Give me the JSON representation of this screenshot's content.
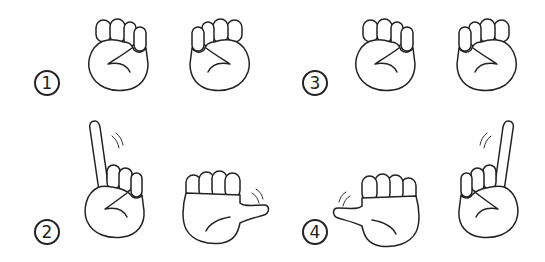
{
  "figure": {
    "line_color": "#222222",
    "background": "#ffffff",
    "steps": [
      {
        "number": "1",
        "label": "Both hands in fists",
        "left_hand": "fist",
        "right_hand": "fist"
      },
      {
        "number": "2",
        "label": "Left index finger raised, right thumb extended",
        "left_hand": "index-up",
        "right_hand": "thumb-out"
      },
      {
        "number": "3",
        "label": "Both hands in fists",
        "left_hand": "fist",
        "right_hand": "fist"
      },
      {
        "number": "4",
        "label": "Left thumb extended, right index finger raised",
        "left_hand": "thumb-out",
        "right_hand": "index-up"
      }
    ]
  }
}
